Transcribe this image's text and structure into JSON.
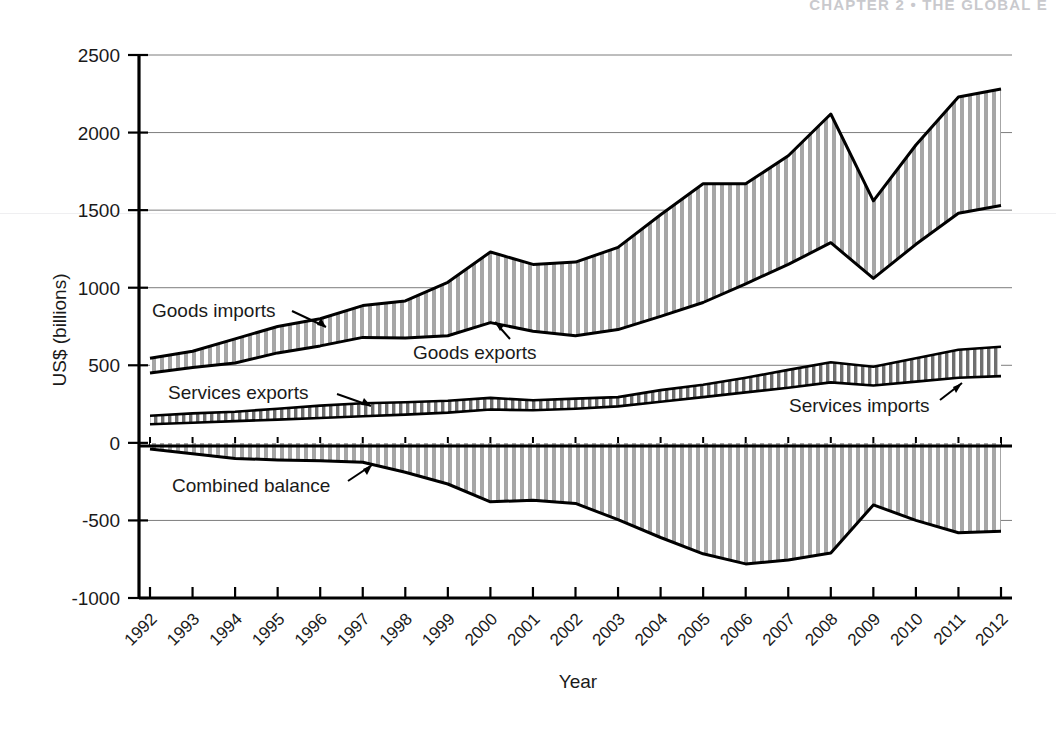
{
  "page_header": {
    "text": "CHAPTER 2  •  THE GLOBAL E"
  },
  "chart_data": {
    "type": "area",
    "title": "",
    "subtitle": "",
    "xlabel": "Year",
    "ylabel": "US$ (billions)",
    "xlim": [
      1992,
      2012
    ],
    "ylim": [
      -1000,
      2500
    ],
    "ytick_labels": [
      "2500",
      "2000",
      "1500",
      "1000",
      "500",
      "0",
      "-500",
      "-1000"
    ],
    "ytick_values": [
      2500,
      2000,
      1500,
      1000,
      500,
      0,
      -500,
      -1000
    ],
    "grid": true,
    "legend_position": "inline-annotations",
    "categories": [
      1992,
      1993,
      1994,
      1995,
      1996,
      1997,
      1998,
      1999,
      2000,
      2001,
      2002,
      2003,
      2004,
      2005,
      2006,
      2007,
      2008,
      2009,
      2010,
      2011,
      2012
    ],
    "xtick_labels": [
      "1992",
      "1993",
      "1994",
      "1995",
      "1996",
      "1997",
      "1998",
      "1999",
      "2000",
      "2001",
      "2002",
      "2003",
      "2004",
      "2005",
      "2006",
      "2007",
      "2008",
      "2009",
      "2010",
      "2011",
      "2012"
    ],
    "series": [
      {
        "name": "Goods imports",
        "values": [
          545,
          590,
          670,
          750,
          800,
          885,
          915,
          1035,
          1230,
          1150,
          1165,
          1260,
          1470,
          1670,
          1670,
          1850,
          2120,
          1560,
          1920,
          2230,
          2280
        ]
      },
      {
        "name": "Goods exports",
        "values": [
          450,
          485,
          515,
          580,
          625,
          680,
          675,
          690,
          775,
          720,
          690,
          730,
          815,
          905,
          1025,
          1150,
          1290,
          1060,
          1280,
          1480,
          1530
        ]
      },
      {
        "name": "Services exports",
        "values": [
          175,
          190,
          200,
          220,
          240,
          255,
          262,
          272,
          290,
          275,
          285,
          295,
          340,
          375,
          420,
          470,
          520,
          490,
          545,
          600,
          620
        ]
      },
      {
        "name": "Services imports",
        "values": [
          120,
          130,
          140,
          150,
          160,
          172,
          182,
          195,
          215,
          210,
          220,
          235,
          265,
          295,
          325,
          355,
          390,
          370,
          395,
          420,
          430
        ]
      },
      {
        "name": "Combined balance",
        "values": [
          -40,
          -70,
          -100,
          -110,
          -115,
          -125,
          -190,
          -265,
          -380,
          -370,
          -390,
          -495,
          -610,
          -715,
          -780,
          -755,
          -710,
          -400,
          -500,
          -580,
          -570
        ]
      }
    ],
    "annotations": [
      {
        "label": "Goods imports",
        "series": "Goods imports"
      },
      {
        "label": "Goods exports",
        "series": "Goods exports"
      },
      {
        "label": "Services exports",
        "series": "Services exports"
      },
      {
        "label": "Services imports",
        "series": "Services imports"
      },
      {
        "label": "Combined balance",
        "series": "Combined balance"
      }
    ]
  }
}
